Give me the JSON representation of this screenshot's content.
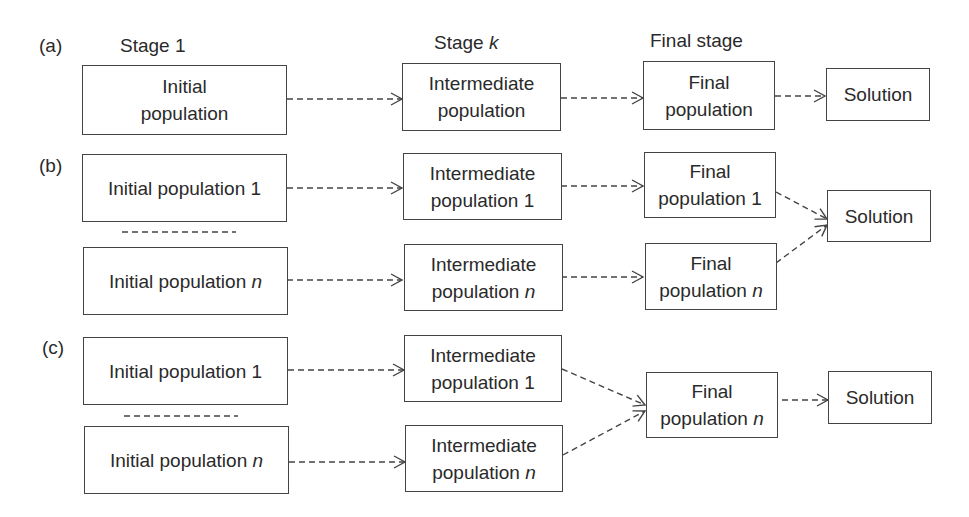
{
  "panels": {
    "a": {
      "label": "(a)"
    },
    "b": {
      "label": "(b)"
    },
    "c": {
      "label": "(c)"
    }
  },
  "stage_headers": {
    "stage1": "Stage 1",
    "stagek_prefix": "Stage ",
    "stagek_var": "k",
    "final": "Final stage"
  },
  "nodes": {
    "a_initial": {
      "line1": "Initial",
      "line2": "population"
    },
    "a_intermediate": {
      "line1": "Intermediate",
      "line2": "population"
    },
    "a_final": {
      "line1": "Final",
      "line2": "population"
    },
    "a_solution": {
      "line1": "Solution"
    },
    "b_initial_1": {
      "line1": "Initial population 1"
    },
    "b_initial_n": {
      "line1": "Initial population ",
      "var": "n"
    },
    "b_intermediate_1": {
      "line1": "Intermediate",
      "line2": "population 1"
    },
    "b_intermediate_n": {
      "line1": "Intermediate",
      "line2": "population ",
      "var": "n"
    },
    "b_final_1": {
      "line1": "Final",
      "line2": "population 1"
    },
    "b_final_n": {
      "line1": "Final",
      "line2": "population ",
      "var": "n"
    },
    "b_solution": {
      "line1": "Solution"
    },
    "c_initial_1": {
      "line1": "Initial population 1"
    },
    "c_initial_n": {
      "line1": "Initial population ",
      "var": "n"
    },
    "c_intermediate_1": {
      "line1": "Intermediate",
      "line2": "population 1"
    },
    "c_intermediate_n": {
      "line1": "Intermediate",
      "line2": "population ",
      "var": "n"
    },
    "c_final_n": {
      "line1": "Final",
      "line2": "population ",
      "var": "n"
    },
    "c_solution": {
      "line1": "Solution"
    }
  },
  "edges": [
    {
      "from": "a_initial",
      "to": "a_intermediate",
      "style": "dashed-arrow"
    },
    {
      "from": "a_intermediate",
      "to": "a_final",
      "style": "dashed-arrow"
    },
    {
      "from": "a_final",
      "to": "a_solution",
      "style": "dashed-arrow"
    },
    {
      "from": "b_initial_1",
      "to": "b_intermediate_1",
      "style": "dashed-arrow"
    },
    {
      "from": "b_initial_n",
      "to": "b_intermediate_n",
      "style": "dashed-arrow"
    },
    {
      "from": "b_intermediate_1",
      "to": "b_final_1",
      "style": "dashed-arrow"
    },
    {
      "from": "b_intermediate_n",
      "to": "b_final_n",
      "style": "dashed-arrow"
    },
    {
      "from": "b_final_1",
      "to": "b_solution",
      "style": "dashed-arrow"
    },
    {
      "from": "b_final_n",
      "to": "b_solution",
      "style": "dashed-arrow"
    },
    {
      "from": "c_initial_1",
      "to": "c_intermediate_1",
      "style": "dashed-arrow"
    },
    {
      "from": "c_initial_n",
      "to": "c_intermediate_n",
      "style": "dashed-arrow"
    },
    {
      "from": "c_intermediate_1",
      "to": "c_final_n",
      "style": "dashed-arrow"
    },
    {
      "from": "c_intermediate_n",
      "to": "c_final_n",
      "style": "dashed-arrow"
    },
    {
      "from": "c_final_n",
      "to": "c_solution",
      "style": "dashed-arrow"
    }
  ],
  "colors": {
    "stroke": "#444444",
    "text": "#2a2a2a",
    "background": "#ffffff"
  }
}
